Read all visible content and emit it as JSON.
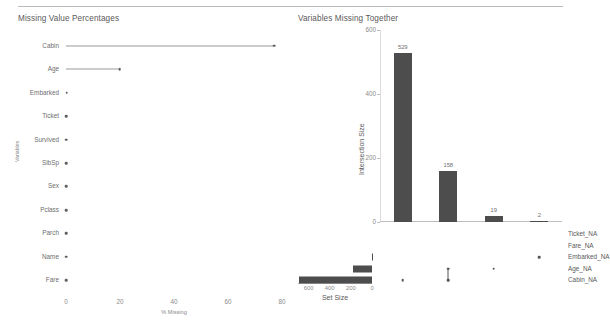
{
  "chart_data": [
    {
      "type": "bar",
      "title": "Missing Value Percentages",
      "orientation": "horizontal",
      "style": "lollipop",
      "xlabel": "% Missing",
      "ylabel": "Variables",
      "xlim": [
        0,
        80
      ],
      "xticks": [
        "0",
        "20",
        "40",
        "60",
        "80"
      ],
      "xtick_values": [
        0,
        20,
        40,
        60,
        80
      ],
      "grid": false,
      "categories": [
        "Cabin",
        "Age",
        "Embarked",
        "Ticket",
        "Survived",
        "SibSp",
        "Sex",
        "Pclass",
        "Parch",
        "Name",
        "Fare"
      ],
      "values": [
        77.1,
        19.9,
        0.2,
        0,
        0,
        0,
        0,
        0,
        0,
        0,
        0
      ]
    },
    {
      "type": "bar",
      "title": "Variables Missing Together",
      "subtype": "upset",
      "ylabel": "Intersection Size",
      "ylim": [
        0,
        600
      ],
      "yticks": [
        "0",
        "200",
        "400",
        "600"
      ],
      "ytick_values": [
        0,
        200,
        400,
        600
      ],
      "grid": false,
      "bar_labels": [
        "529",
        "158",
        "19",
        "2"
      ],
      "values": [
        529,
        158,
        19,
        2
      ],
      "sets": [
        "Ticket_NA",
        "Fare_NA",
        "Embarked_NA",
        "Age_NA",
        "Cabin_NA"
      ],
      "intersections": [
        {
          "label": "529",
          "value": 529,
          "members": [
            "Cabin_NA"
          ]
        },
        {
          "label": "158",
          "value": 158,
          "members": [
            "Age_NA",
            "Cabin_NA"
          ]
        },
        {
          "label": "19",
          "value": 19,
          "members": [
            "Age_NA"
          ]
        },
        {
          "label": "2",
          "value": 2,
          "members": [
            "Embarked_NA"
          ]
        }
      ],
      "set_size": {
        "title": "Set Size",
        "ticks": [
          "600",
          "400",
          "200",
          "0"
        ],
        "tick_values": [
          600,
          400,
          200,
          0
        ],
        "reversed": true,
        "bars": [
          {
            "name": "Ticket_NA",
            "value": 0
          },
          {
            "name": "Fare_NA",
            "value": 0
          },
          {
            "name": "Embarked_NA",
            "value": 2
          },
          {
            "name": "Age_NA",
            "value": 177
          },
          {
            "name": "Cabin_NA",
            "value": 687
          }
        ]
      }
    }
  ],
  "left": {
    "title": "Missing Value Percentages",
    "yaxis_title": "Variables",
    "xaxis_title": "% Missing",
    "xticks": [
      "0",
      "20",
      "40",
      "60",
      "80"
    ],
    "rows": [
      {
        "label": "Cabin",
        "value": 77.1
      },
      {
        "label": "Age",
        "value": 19.9
      },
      {
        "label": "Embarked",
        "value": 0.2
      },
      {
        "label": "Ticket",
        "value": 0
      },
      {
        "label": "Survived",
        "value": 0
      },
      {
        "label": "SibSp",
        "value": 0
      },
      {
        "label": "Sex",
        "value": 0
      },
      {
        "label": "Pclass",
        "value": 0
      },
      {
        "label": "Parch",
        "value": 0
      },
      {
        "label": "Name",
        "value": 0
      },
      {
        "label": "Fare",
        "value": 0
      }
    ]
  },
  "right": {
    "title": "Variables Missing Together",
    "yaxis_title": "Intersection Size",
    "yticks": [
      "600",
      "400",
      "200",
      "0"
    ],
    "bars": [
      {
        "label": "529",
        "value": 529
      },
      {
        "label": "158",
        "value": 158
      },
      {
        "label": "19",
        "value": 19
      },
      {
        "label": "2",
        "value": 2
      }
    ],
    "sets": [
      "Ticket_NA",
      "Fare_NA",
      "Embarked_NA",
      "Age_NA",
      "Cabin_NA"
    ],
    "set_size_title": "Set Size",
    "set_size_ticks": [
      "600",
      "400",
      "200",
      "0"
    ],
    "set_size_values": [
      0,
      0,
      2,
      177,
      687
    ]
  },
  "colors": {
    "bar": "#4d4d4d",
    "dot": "#555555",
    "dot_off": "#e3e3e3",
    "axis": "#bdbdbd",
    "text": "#5a5a5a",
    "muted": "#8a8a8a"
  }
}
